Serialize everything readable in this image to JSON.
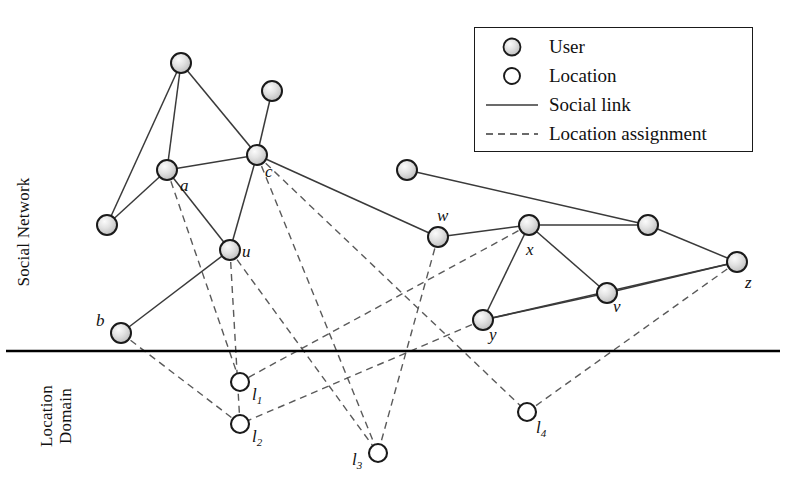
{
  "figure": {
    "width": 805,
    "height": 491,
    "background": "#ffffff"
  },
  "axis_labels": {
    "social_network": "Social Network",
    "location_domain_line1": "Location",
    "location_domain_line2": "Domain"
  },
  "legend": {
    "title": "",
    "items": [
      {
        "symbol": "user-node",
        "label": "User"
      },
      {
        "symbol": "location-node",
        "label": "Location"
      },
      {
        "symbol": "solid-line",
        "label": "Social link"
      },
      {
        "symbol": "dashed-line",
        "label": "Location assignment"
      }
    ]
  },
  "colors": {
    "user_fill_light": "#f2f2f2",
    "user_fill_mid": "#cfcfcf",
    "user_stroke": "#1a1a1a",
    "location_fill": "#ffffff",
    "location_stroke": "#1a1a1a",
    "social_link": "#3a3a3a",
    "assignment_link": "#5a5a5a",
    "divider": "#000000",
    "text": "#111111"
  },
  "divider": {
    "name": "domain-divider",
    "x1": 6,
    "y1": 351,
    "x2": 780,
    "y2": 351
  },
  "users": [
    {
      "id": "n1",
      "label": "",
      "x": 181,
      "y": 63,
      "lx": 0,
      "ly": 0
    },
    {
      "id": "n2",
      "label": "",
      "x": 272,
      "y": 91,
      "lx": 0,
      "ly": 0
    },
    {
      "id": "a",
      "label": "a",
      "x": 167,
      "y": 170,
      "lx": 180,
      "ly": 176
    },
    {
      "id": "c",
      "label": "c",
      "x": 257,
      "y": 155,
      "lx": 265,
      "ly": 162
    },
    {
      "id": "n3",
      "label": "",
      "x": 107,
      "y": 225,
      "lx": 0,
      "ly": 0
    },
    {
      "id": "u",
      "label": "u",
      "x": 230,
      "y": 250,
      "lx": 242,
      "ly": 242
    },
    {
      "id": "b",
      "label": "b",
      "x": 121,
      "y": 333,
      "lx": 96,
      "ly": 311
    },
    {
      "id": "n4",
      "label": "",
      "x": 407,
      "y": 170,
      "lx": 0,
      "ly": 0
    },
    {
      "id": "w",
      "label": "w",
      "x": 438,
      "y": 237,
      "lx": 437,
      "ly": 206
    },
    {
      "id": "x",
      "label": "x",
      "x": 529,
      "y": 225,
      "lx": 526,
      "ly": 240
    },
    {
      "id": "n5",
      "label": "",
      "x": 648,
      "y": 225,
      "lx": 0,
      "ly": 0
    },
    {
      "id": "y",
      "label": "y",
      "x": 483,
      "y": 320,
      "lx": 489,
      "ly": 325
    },
    {
      "id": "v",
      "label": "v",
      "x": 607,
      "y": 293,
      "lx": 613,
      "ly": 297
    },
    {
      "id": "z",
      "label": "z",
      "x": 737,
      "y": 262,
      "lx": 745,
      "ly": 273
    }
  ],
  "locations": [
    {
      "id": "l1",
      "label": "l",
      "sub": "1",
      "x": 240,
      "y": 382,
      "lx": 252,
      "ly": 385
    },
    {
      "id": "l2",
      "label": "l",
      "sub": "2",
      "x": 240,
      "y": 424,
      "lx": 252,
      "ly": 427
    },
    {
      "id": "l3",
      "label": "l",
      "sub": "3",
      "x": 378,
      "y": 453,
      "lx": 352,
      "ly": 450
    },
    {
      "id": "l4",
      "label": "l",
      "sub": "4",
      "x": 527,
      "y": 412,
      "lx": 536,
      "ly": 418
    }
  ],
  "social_links": [
    [
      "n1",
      "n3"
    ],
    [
      "n1",
      "a"
    ],
    [
      "n1",
      "c"
    ],
    [
      "a",
      "n3"
    ],
    [
      "a",
      "c"
    ],
    [
      "a",
      "u"
    ],
    [
      "c",
      "n2"
    ],
    [
      "c",
      "u"
    ],
    [
      "c",
      "w"
    ],
    [
      "u",
      "b"
    ],
    [
      "n4",
      "n5"
    ],
    [
      "w",
      "x"
    ],
    [
      "x",
      "n5"
    ],
    [
      "x",
      "y"
    ],
    [
      "x",
      "v"
    ],
    [
      "y",
      "v"
    ],
    [
      "v",
      "z"
    ],
    [
      "n5",
      "z"
    ],
    [
      "y",
      "z"
    ]
  ],
  "assignment_links": [
    [
      "a",
      "l1"
    ],
    [
      "b",
      "l2"
    ],
    [
      "u",
      "l2"
    ],
    [
      "u",
      "l3"
    ],
    [
      "c",
      "l3"
    ],
    [
      "c",
      "l4"
    ],
    [
      "w",
      "l3"
    ],
    [
      "x",
      "l1"
    ],
    [
      "y",
      "l2"
    ],
    [
      "z",
      "l4"
    ]
  ],
  "geometry": {
    "user_radius": 10,
    "location_radius": 9
  }
}
